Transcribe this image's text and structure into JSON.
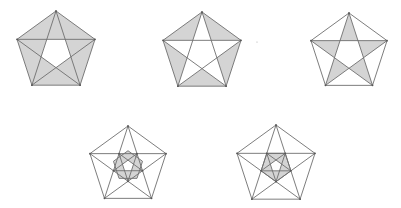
{
  "diagram": {
    "colors": {
      "background": "#ffffff",
      "line": "#6e6e6e",
      "shade": "#d4d4d4",
      "vertex": "#555555"
    },
    "figures": [
      {
        "id": "figure-1",
        "center": [
          56,
          52
        ],
        "radius": 41,
        "rotation_deg": 0,
        "shading": "outer-regions-between-pentagon-and-inner-pentagon",
        "shaded_parts": [
          "star-points",
          "pentagon-corner-triangles"
        ],
        "unshaded_parts": [
          "inner-pentagon"
        ],
        "inner_levels": 0
      },
      {
        "id": "figure-2",
        "center": [
          202,
          53
        ],
        "radius": 41,
        "rotation_deg": 0,
        "shading": "pentagon-corner-triangles",
        "shaded_parts": [
          "pentagon-corner-triangles"
        ],
        "unshaded_parts": [
          "star-points",
          "inner-pentagon"
        ],
        "inner_levels": 0
      },
      {
        "id": "figure-3",
        "center": [
          349,
          53
        ],
        "radius": 40,
        "rotation_deg": 0,
        "shading": "star-points",
        "shaded_parts": [
          "star-points"
        ],
        "unshaded_parts": [
          "pentagon-corner-triangles",
          "inner-pentagon"
        ],
        "inner_levels": 0
      },
      {
        "id": "figure-4",
        "center": [
          128,
          166
        ],
        "radius": 40,
        "rotation_deg": 0,
        "shading": "second-level-star-region-around-innermost-pentagon",
        "shaded_parts": [
          "inner-star-and-corner-region"
        ],
        "unshaded_parts": [
          "innermost-pentagon"
        ],
        "inner_levels": 2
      },
      {
        "id": "figure-5",
        "center": [
          276,
          166
        ],
        "radius": 41,
        "rotation_deg": 0,
        "shading": "inner-pentagon-minus-innermost-pentagon",
        "shaded_parts": [
          "inner-pentagon-ring"
        ],
        "unshaded_parts": [
          "innermost-pentagon"
        ],
        "inner_levels": 2
      }
    ],
    "artifacts": [
      {
        "id": "speck",
        "position": [
          257,
          42
        ]
      }
    ]
  }
}
